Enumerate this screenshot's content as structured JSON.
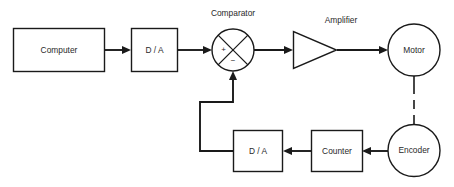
{
  "diagram": {
    "type": "block-diagram",
    "background_color": "#ffffff",
    "line_color": "#1a1a1a",
    "text_color": "#2a2a2a",
    "blocks": {
      "computer": {
        "label": "Computer",
        "shape": "rectangle"
      },
      "dac_forward": {
        "label": "D / A",
        "shape": "rectangle"
      },
      "comparator": {
        "label": "Comparator",
        "shape": "circle-with-cross"
      },
      "comparator_plus": {
        "label": "+"
      },
      "comparator_minus": {
        "label": "−"
      },
      "amplifier": {
        "label": "Amplifier",
        "shape": "triangle"
      },
      "motor": {
        "label": "Motor",
        "shape": "circle"
      },
      "encoder": {
        "label": "Encoder",
        "shape": "circle"
      },
      "counter": {
        "label": "Counter",
        "shape": "rectangle"
      },
      "dac_feedback": {
        "label": "D / A",
        "shape": "rectangle"
      }
    },
    "connections": [
      {
        "from": "computer",
        "to": "dac_forward",
        "style": "solid-arrow"
      },
      {
        "from": "dac_forward",
        "to": "comparator",
        "style": "solid-arrow"
      },
      {
        "from": "comparator",
        "to": "amplifier",
        "style": "solid-arrow"
      },
      {
        "from": "amplifier",
        "to": "motor",
        "style": "solid-arrow"
      },
      {
        "from": "motor",
        "to": "encoder",
        "style": "dashed-mechanical"
      },
      {
        "from": "encoder",
        "to": "counter",
        "style": "solid-arrow"
      },
      {
        "from": "counter",
        "to": "dac_feedback",
        "style": "solid-arrow"
      },
      {
        "from": "dac_feedback",
        "to": "comparator",
        "style": "solid-arrow-routed"
      }
    ]
  }
}
